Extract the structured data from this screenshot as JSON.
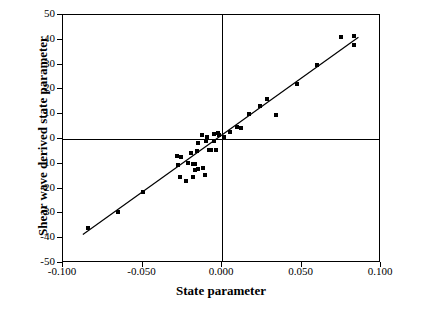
{
  "chart_data": {
    "type": "scatter",
    "title": "",
    "xlabel": "State parameter",
    "ylabel": "Shear wave derived state parameter",
    "xlim": [
      -0.1,
      0.1
    ],
    "ylim": [
      -50,
      50
    ],
    "xticks": [
      "-0.100",
      "-0.050",
      "0.000",
      "0.050",
      "0.100"
    ],
    "xtick_values": [
      -0.1,
      -0.05,
      0.0,
      0.05,
      0.1
    ],
    "yticks": [
      "-50",
      "-40",
      "-30",
      "-20",
      "-10",
      "0",
      "10",
      "20",
      "30",
      "40",
      "50"
    ],
    "ytick_values": [
      -50,
      -40,
      -30,
      -20,
      -10,
      0,
      10,
      20,
      30,
      40,
      50
    ],
    "grid": false,
    "legend": null,
    "marker": "square",
    "marker_color": "#000000",
    "zero_lines": true,
    "series": [
      {
        "name": "Shear wave derived state parameter vs state parameter",
        "points": [
          [
            -0.0845,
            -36.0
          ],
          [
            -0.0655,
            -29.5
          ],
          [
            -0.0495,
            -21.5
          ],
          [
            -0.0282,
            -7.0
          ],
          [
            -0.0275,
            -10.5
          ],
          [
            -0.0262,
            -15.5
          ],
          [
            -0.0258,
            -7.2
          ],
          [
            -0.0228,
            -17.0
          ],
          [
            -0.0212,
            -9.5
          ],
          [
            -0.0198,
            -5.5
          ],
          [
            -0.0185,
            -10.2
          ],
          [
            -0.0182,
            -15.5
          ],
          [
            -0.0172,
            -12.5
          ],
          [
            -0.0168,
            -10.0
          ],
          [
            -0.0158,
            -5.0
          ],
          [
            -0.0152,
            -1.5
          ],
          [
            -0.0148,
            -12.0
          ],
          [
            -0.0125,
            1.5
          ],
          [
            -0.0118,
            -11.5
          ],
          [
            -0.0108,
            -14.5
          ],
          [
            -0.0098,
            -1.0
          ],
          [
            -0.0092,
            1.0
          ],
          [
            -0.0082,
            -4.5
          ],
          [
            -0.0072,
            -4.5
          ],
          [
            -0.0052,
            2.0
          ],
          [
            -0.0048,
            -1.0
          ],
          [
            -0.0035,
            -4.5
          ],
          [
            -0.0028,
            2.5
          ],
          [
            -0.0018,
            1.5
          ],
          [
            0.0012,
            1.0
          ],
          [
            0.0048,
            3.0
          ],
          [
            0.0092,
            5.0
          ],
          [
            0.0118,
            4.5
          ],
          [
            0.0172,
            10.0
          ],
          [
            0.0238,
            13.5
          ],
          [
            0.0285,
            16.0
          ],
          [
            0.0342,
            9.5
          ],
          [
            0.0472,
            22.0
          ],
          [
            0.0598,
            30.0
          ],
          [
            0.0748,
            41.0
          ],
          [
            0.0828,
            41.5
          ],
          [
            0.0832,
            38.0
          ]
        ]
      }
    ],
    "trendline": {
      "x0": -0.0875,
      "y0": -38.5,
      "x1": 0.0858,
      "y1": 41.0
    }
  }
}
